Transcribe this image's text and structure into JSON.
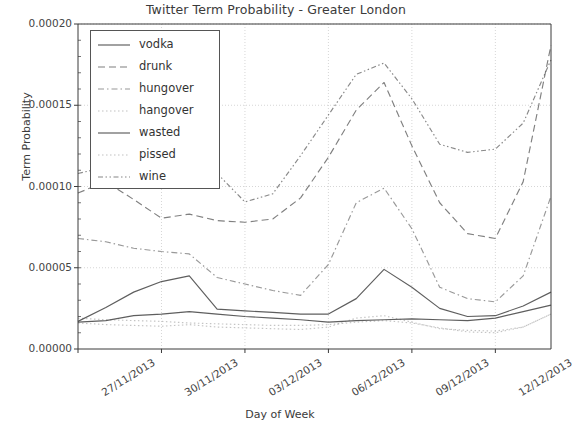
{
  "chart_data": {
    "type": "line",
    "title": "Twitter Term Probability - Greater London",
    "xlabel": "Day of Week",
    "ylabel": "Term Probability",
    "grid": true,
    "legend_position": "upper left",
    "xlim": [
      0,
      17
    ],
    "ylim": [
      0.0,
      0.0002
    ],
    "ytick_labels": [
      "0.00000",
      "0.00005",
      "0.00010",
      "0.00015",
      "0.00020"
    ],
    "ytick_values": [
      0.0,
      5e-05,
      0.0001,
      0.00015,
      0.0002
    ],
    "xtick_labels": [
      "27/11/2013",
      "30/11/2013",
      "03/12/2013",
      "06/12/2013",
      "09/12/2013",
      "12/12/2013"
    ],
    "xtick_positions": [
      0,
      3,
      6,
      9,
      12,
      15
    ],
    "x": [
      0,
      1,
      2,
      3,
      4,
      5,
      6,
      7,
      8,
      9,
      10,
      11,
      12,
      13,
      14,
      15,
      16,
      17
    ],
    "series": [
      {
        "name": "vodka",
        "linestyle": "solid",
        "values": [
          1.65e-05,
          1.75e-05,
          2.05e-05,
          2.15e-05,
          2.3e-05,
          2.15e-05,
          2e-05,
          1.9e-05,
          1.8e-05,
          1.65e-05,
          1.75e-05,
          1.8e-05,
          1.85e-05,
          1.8e-05,
          1.75e-05,
          1.9e-05,
          2.3e-05,
          2.7e-05
        ]
      },
      {
        "name": "drunk",
        "linestyle": "dashed",
        "values": [
          9.6e-05,
          0.000103,
          9.2e-05,
          8.05e-05,
          8.3e-05,
          7.9e-05,
          7.8e-05,
          8e-05,
          9.3e-05,
          0.000118,
          0.000147,
          0.000164,
          0.000125,
          9e-05,
          7.1e-05,
          6.8e-05,
          0.000103,
          0.000187
        ]
      },
      {
        "name": "hungover",
        "linestyle": "dashdot",
        "values": [
          6.8e-05,
          6.6e-05,
          6.2e-05,
          6e-05,
          5.85e-05,
          4.4e-05,
          4e-05,
          3.6e-05,
          3.3e-05,
          5.2e-05,
          9e-05,
          9.9e-05,
          7.4e-05,
          3.8e-05,
          3.1e-05,
          2.9e-05,
          4.5e-05,
          9.4e-05
        ]
      },
      {
        "name": "hangover",
        "linestyle": "dotted",
        "values": [
          1.6e-05,
          1.5e-05,
          1.45e-05,
          1.4e-05,
          1.5e-05,
          1.35e-05,
          1.3e-05,
          1.25e-05,
          1.2e-05,
          1.35e-05,
          1.9e-05,
          2.05e-05,
          1.65e-05,
          1.25e-05,
          1.15e-05,
          1.1e-05,
          1.35e-05,
          2.15e-05
        ]
      },
      {
        "name": "wasted",
        "linestyle": "solid",
        "values": [
          1.7e-05,
          2.55e-05,
          3.5e-05,
          4.15e-05,
          4.5e-05,
          2.45e-05,
          2.35e-05,
          2.25e-05,
          2.15e-05,
          2.15e-05,
          3.1e-05,
          4.9e-05,
          3.8e-05,
          2.5e-05,
          2e-05,
          2.05e-05,
          2.65e-05,
          3.5e-05
        ]
      },
      {
        "name": "pissed",
        "linestyle": "dotted",
        "values": [
          1.9e-05,
          1.8e-05,
          1.75e-05,
          1.7e-05,
          1.6e-05,
          1.55e-05,
          1.5e-05,
          1.45e-05,
          1.45e-05,
          1.5e-05,
          1.65e-05,
          1.75e-05,
          1.6e-05,
          1.3e-05,
          1.05e-05,
          1e-05,
          1.35e-05,
          2.15e-05
        ]
      },
      {
        "name": "wine",
        "linestyle": "dashdotdot",
        "values": [
          0.000108,
          0.000112,
          0.000111,
          0.0001115,
          0.000113,
          0.000108,
          9.05e-05,
          9.55e-05,
          0.000119,
          0.000144,
          0.000169,
          0.000176,
          0.000154,
          0.000126,
          0.000121,
          0.000123,
          0.000139,
          0.000178
        ]
      }
    ]
  },
  "legend": {
    "entries": [
      {
        "label": "vodka"
      },
      {
        "label": "drunk"
      },
      {
        "label": "hungover"
      },
      {
        "label": "hangover"
      },
      {
        "label": "wasted"
      },
      {
        "label": "pissed"
      },
      {
        "label": "wine"
      }
    ]
  },
  "colors": {
    "line": "#555555",
    "axis": "#3a3a3a",
    "grid": "#cccccc",
    "background": "#ffffff"
  }
}
